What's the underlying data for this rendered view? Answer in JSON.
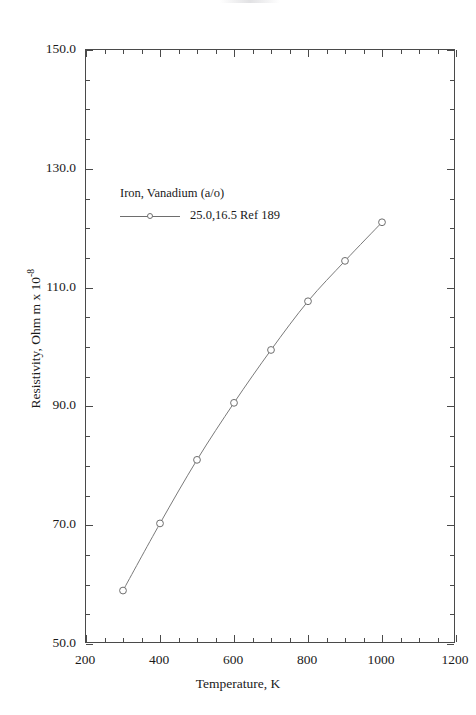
{
  "chart_data": {
    "type": "line",
    "title": "Cobalt Iron Vanadium",
    "xlabel": "Temperature,  K",
    "ylabel_text": "Resistivity, Ohm m x 10",
    "ylabel_exponent": "-8",
    "xlim": [
      200,
      1200
    ],
    "ylim": [
      50.0,
      150.0
    ],
    "x_major_ticks": [
      200,
      400,
      600,
      800,
      1000,
      1200
    ],
    "x_tick_labels": [
      "200",
      "400",
      "600",
      "800",
      "1000",
      "1200"
    ],
    "x_minor_step": 50,
    "y_major_ticks": [
      50.0,
      70.0,
      90.0,
      110.0,
      130.0,
      150.0
    ],
    "y_tick_labels": [
      "50.0",
      "70.0",
      "90.0",
      "110.0",
      "130.0",
      "150.0"
    ],
    "y_minor_step": 5,
    "grid": false,
    "legend_position": "inside-upper-left",
    "legend_title": "Iron, Vanadium (a/o)",
    "series": [
      {
        "name": "25.0,16.5 Ref 189",
        "marker": "open-circle",
        "color": "#6e6e6e",
        "x": [
          300,
          400,
          500,
          600,
          700,
          800,
          900,
          1000
        ],
        "values": [
          59.0,
          70.3,
          81.0,
          90.6,
          99.5,
          107.7,
          114.5,
          121.0
        ]
      }
    ]
  },
  "legend": {
    "title": "Iron, Vanadium (a/o)",
    "entries": [
      {
        "label": "25.0,16.5 Ref 189"
      }
    ]
  },
  "axes": {
    "x_title": "Temperature,  K",
    "y_title_main": "Resistivity, Ohm m x 10",
    "y_title_sup": "-8"
  },
  "title": "Cobalt Iron Vanadium",
  "colors": {
    "series": "#6e6e6e",
    "axis": "#4a4a4a",
    "text": "#1a1a1a",
    "background": "#ffffff"
  }
}
